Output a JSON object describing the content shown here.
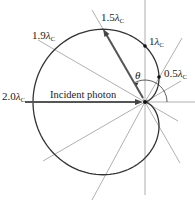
{
  "diagram": {
    "incident_label": "Incident photon",
    "angle_label": "θ",
    "lambda_symbol": "λ",
    "lambda_subscript": "C",
    "shift_labels": [
      {
        "id": "2.0",
        "coef": "2.0",
        "angle_deg": 180
      },
      {
        "id": "1.9",
        "coef": "1.9",
        "angle_deg": 154
      },
      {
        "id": "1.5",
        "coef": "1.5",
        "angle_deg": 120
      },
      {
        "id": "1",
        "coef": "1",
        "angle_deg": 90
      },
      {
        "id": "0.5",
        "coef": "0.5",
        "angle_deg": 60
      }
    ],
    "ray_angles_deg": [
      0,
      30,
      60,
      90,
      120,
      150,
      180,
      210,
      240,
      270,
      300,
      330
    ],
    "curve": "Δλ = λC(1 − cos θ)",
    "colors": {
      "curve": "#333333",
      "rays": "#777777",
      "arrow": "#555555"
    }
  }
}
